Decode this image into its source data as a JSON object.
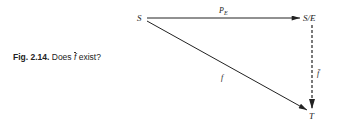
{
  "caption": {
    "figure_number": "Fig. 2.14.",
    "text_before": "Does",
    "symbol": "f",
    "text_after": "exist?"
  },
  "diagram": {
    "nodes": {
      "source": "S",
      "quotient": "S/E",
      "target": "T"
    },
    "arrows": {
      "projection": {
        "label": "P",
        "subscript": "E",
        "from": "S",
        "to": "S/E",
        "style": "solid"
      },
      "map": {
        "label": "f",
        "from": "S",
        "to": "T",
        "style": "solid"
      },
      "induced": {
        "label": "f̄",
        "from": "S/E",
        "to": "T",
        "style": "dashed"
      }
    },
    "colors": {
      "ink": "#222222",
      "background": "#ffffff"
    }
  }
}
